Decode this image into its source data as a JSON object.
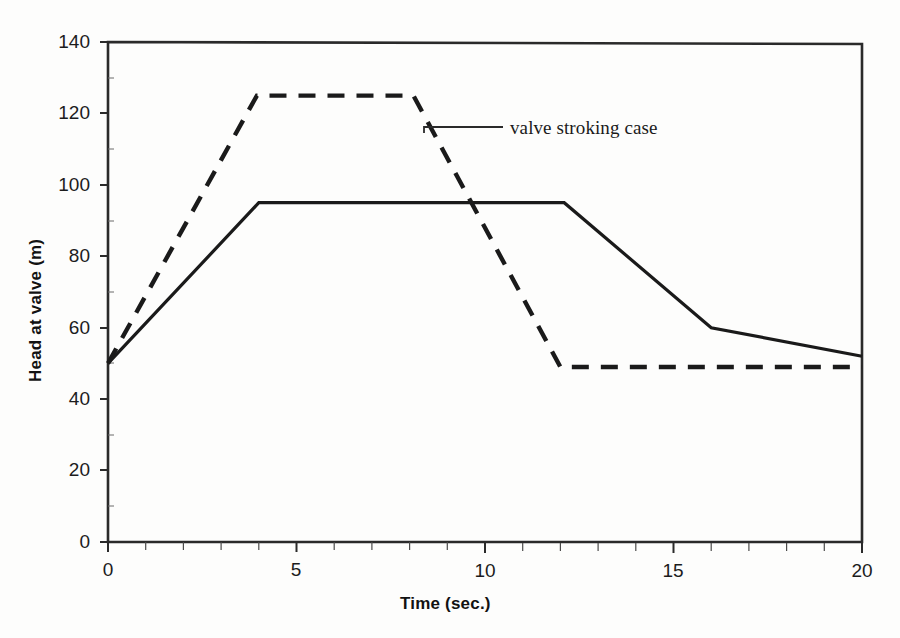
{
  "chart_data": {
    "type": "line",
    "title": "",
    "xlabel": "Time (sec.)",
    "ylabel": "Head at valve (m)",
    "xlim": [
      0,
      20
    ],
    "ylim": [
      0,
      140
    ],
    "xticks": [
      "0",
      "5",
      "10",
      "15",
      "20"
    ],
    "xtick_values": [
      0,
      5,
      10,
      15,
      20
    ],
    "x_minor_tick_step": 1,
    "yticks": [
      "0",
      "20",
      "40",
      "60",
      "80",
      "100",
      "120",
      "140"
    ],
    "ytick_values": [
      0,
      20,
      40,
      60,
      80,
      100,
      120,
      140
    ],
    "grid": false,
    "legend_position": "none",
    "frame": "box",
    "series": [
      {
        "name": "rapid valve closure case",
        "style": "solid",
        "color": "#1a1a1a",
        "x": [
          0,
          4.0,
          12.1,
          16.0,
          20.0
        ],
        "y": [
          50,
          95,
          95,
          60,
          52
        ]
      },
      {
        "name": "valve stroking case",
        "style": "dashed",
        "color": "#1a1a1a",
        "x": [
          0,
          3.95,
          8.1,
          12.0,
          20.0
        ],
        "y": [
          50,
          125,
          125,
          49,
          49
        ]
      }
    ],
    "annotations": [
      {
        "text": "valve stroking case",
        "target_x": 8.4,
        "target_y": 119,
        "leader_to_x": 10.5,
        "leader_to_y": 119
      }
    ]
  },
  "axis": {
    "x_title": "Time (sec.)",
    "y_title": "Head at valve (m)"
  },
  "annotation": {
    "valve_stroking_case": "valve stroking case"
  },
  "ticks": {
    "y": {
      "t140": "140",
      "t120": "120",
      "t100": "100",
      "t80": "80",
      "t60": "60",
      "t40": "40",
      "t20": "20",
      "t0": "0"
    },
    "x": {
      "t0": "0",
      "t5": "5",
      "t10": "10",
      "t15": "15",
      "t20": "20"
    }
  },
  "colors": {
    "ink": "#1a1a1a",
    "background": "#fdfdfc"
  }
}
